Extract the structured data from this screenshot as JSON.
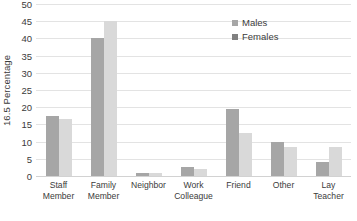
{
  "chart_data": {
    "type": "bar",
    "title": "",
    "xlabel": "",
    "ylabel": "16.5 Percentage",
    "ylim": [
      0,
      50
    ],
    "ytick_step": 5,
    "yticks": [
      0,
      5,
      10,
      15,
      20,
      25,
      30,
      35,
      40,
      45,
      50
    ],
    "grid": true,
    "legend_position": "top-right",
    "categories": [
      "Staff\nMember",
      "Family\nMember",
      "Neighbor",
      "Work\nColleague",
      "Friend",
      "Other",
      "Lay Teacher"
    ],
    "series": [
      {
        "name": "Males",
        "color": "#a6a6a6",
        "values": [
          17.5,
          40,
          1,
          2.5,
          19.5,
          10,
          4
        ]
      },
      {
        "name": "Females",
        "color": "#d9d9d9",
        "values": [
          16.5,
          45,
          1,
          2,
          12.5,
          8.5,
          8.5
        ]
      }
    ]
  },
  "legend": {
    "items": [
      {
        "label": "Males"
      },
      {
        "label": "Females"
      }
    ]
  }
}
